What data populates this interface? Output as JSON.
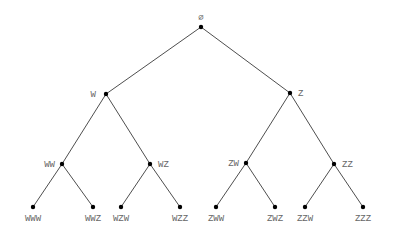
{
  "diagram": {
    "type": "binary-tree",
    "colors": {
      "edge": "#3a3a3a",
      "node": "#000000",
      "label": "#666666",
      "background": "#ffffff"
    },
    "nodes": [
      {
        "id": "root",
        "label": "∅",
        "x": 201,
        "y": 27,
        "lx": 201,
        "ly": 20,
        "anchor": "middle"
      },
      {
        "id": "W",
        "label": "W",
        "x": 106,
        "y": 94,
        "lx": 96,
        "ly": 97,
        "anchor": "end"
      },
      {
        "id": "Z",
        "label": "Z",
        "x": 290,
        "y": 93,
        "lx": 298,
        "ly": 96,
        "anchor": "start"
      },
      {
        "id": "WW",
        "label": "WW",
        "x": 62,
        "y": 164,
        "lx": 55,
        "ly": 167,
        "anchor": "end"
      },
      {
        "id": "WZ",
        "label": "WZ",
        "x": 150,
        "y": 164,
        "lx": 158,
        "ly": 167,
        "anchor": "start"
      },
      {
        "id": "ZW",
        "label": "ZW",
        "x": 246,
        "y": 163,
        "lx": 239,
        "ly": 166,
        "anchor": "end"
      },
      {
        "id": "ZZ",
        "label": "ZZ",
        "x": 334,
        "y": 164,
        "lx": 342,
        "ly": 167,
        "anchor": "start"
      },
      {
        "id": "WWW",
        "label": "WWW",
        "x": 33,
        "y": 207,
        "lx": 33,
        "ly": 221,
        "anchor": "middle"
      },
      {
        "id": "WWZ",
        "label": "WWZ",
        "x": 93,
        "y": 207,
        "lx": 93,
        "ly": 221,
        "anchor": "middle"
      },
      {
        "id": "WZW",
        "label": "WZW",
        "x": 121,
        "y": 207,
        "lx": 121,
        "ly": 221,
        "anchor": "middle"
      },
      {
        "id": "WZZ",
        "label": "WZZ",
        "x": 180,
        "y": 207,
        "lx": 180,
        "ly": 221,
        "anchor": "middle"
      },
      {
        "id": "ZWW",
        "label": "ZWW",
        "x": 216,
        "y": 207,
        "lx": 216,
        "ly": 221,
        "anchor": "middle"
      },
      {
        "id": "ZWZ",
        "label": "ZWZ",
        "x": 275,
        "y": 207,
        "lx": 275,
        "ly": 221,
        "anchor": "middle"
      },
      {
        "id": "ZZW",
        "label": "ZZW",
        "x": 305,
        "y": 207,
        "lx": 305,
        "ly": 221,
        "anchor": "middle"
      },
      {
        "id": "ZZZ",
        "label": "ZZZ",
        "x": 363,
        "y": 207,
        "lx": 363,
        "ly": 221,
        "anchor": "middle"
      }
    ],
    "edges": [
      [
        "root",
        "W"
      ],
      [
        "root",
        "Z"
      ],
      [
        "W",
        "WW"
      ],
      [
        "W",
        "WZ"
      ],
      [
        "Z",
        "ZW"
      ],
      [
        "Z",
        "ZZ"
      ],
      [
        "WW",
        "WWW"
      ],
      [
        "WW",
        "WWZ"
      ],
      [
        "WZ",
        "WZW"
      ],
      [
        "WZ",
        "WZZ"
      ],
      [
        "ZW",
        "ZWW"
      ],
      [
        "ZW",
        "ZWZ"
      ],
      [
        "ZZ",
        "ZZW"
      ],
      [
        "ZZ",
        "ZZZ"
      ]
    ]
  }
}
